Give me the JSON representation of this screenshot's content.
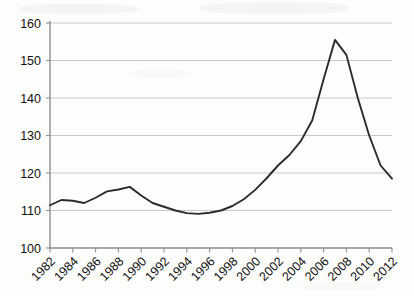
{
  "chart_data": {
    "type": "line",
    "title": "",
    "subtitle": "",
    "xlabel": "",
    "ylabel": "",
    "grid": true,
    "legend": false,
    "legend_position": "none",
    "line_color": "#2b2b2b",
    "grid_color": "#c9c9c9",
    "axis_color": "#8e8e8e",
    "background_color": "#fdfdfc",
    "xlim": [
      1982,
      2012
    ],
    "ylim": [
      100,
      160
    ],
    "y_ticks": [
      100,
      110,
      120,
      130,
      140,
      150,
      160
    ],
    "y_tick_labels": [
      "100",
      "110",
      "120",
      "130",
      "140",
      "150",
      "160"
    ],
    "x_ticks": [
      1982,
      1984,
      1986,
      1988,
      1990,
      1992,
      1994,
      1996,
      1998,
      2000,
      2002,
      2004,
      2006,
      2008,
      2010,
      2012
    ],
    "x_tick_labels": [
      "1982",
      "1984",
      "1986",
      "1988",
      "1990",
      "1992",
      "1994",
      "1996",
      "1998",
      "2000",
      "2002",
      "2004",
      "2006",
      "2008",
      "2010",
      "2012"
    ],
    "x_tick_rotation": -45,
    "x": [
      1982,
      1983,
      1984,
      1985,
      1986,
      1987,
      1988,
      1989,
      1990,
      1991,
      1992,
      1993,
      1994,
      1995,
      1996,
      1997,
      1998,
      1999,
      2000,
      2001,
      2002,
      2003,
      2004,
      2005,
      2006,
      2007,
      2008,
      2009,
      2010,
      2011,
      2012
    ],
    "values": [
      111.4,
      112.8,
      112.6,
      112.0,
      113.4,
      115.1,
      115.6,
      116.3,
      114.0,
      112.0,
      111.0,
      110.0,
      109.3,
      109.1,
      109.4,
      110.0,
      111.2,
      113.0,
      115.5,
      118.6,
      122.0,
      124.8,
      128.5,
      134.0,
      145.0,
      155.5,
      151.5,
      140.0,
      130.0,
      122.0,
      118.5
    ],
    "series": [
      {
        "name": "index",
        "values": [
          111.4,
          112.8,
          112.6,
          112.0,
          113.4,
          115.1,
          115.6,
          116.3,
          114.0,
          112.0,
          111.0,
          110.0,
          109.3,
          109.1,
          109.4,
          110.0,
          111.2,
          113.0,
          115.5,
          118.6,
          122.0,
          124.8,
          128.5,
          134.0,
          145.0,
          155.5,
          151.5,
          140.0,
          130.0,
          122.0,
          118.5
        ]
      }
    ],
    "annotations": {
      "peak_year": 2007,
      "peak_value": 155.5,
      "trough_year": 1995,
      "trough_value": 109.1,
      "first_value": 111.4,
      "last_value": 118.5
    }
  }
}
